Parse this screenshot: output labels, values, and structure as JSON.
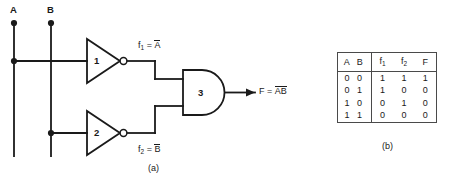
{
  "figure": {
    "caption_a": "(a)",
    "caption_b": "(b)"
  },
  "circuit": {
    "inputs": [
      {
        "label": "A",
        "name": "input-a"
      },
      {
        "label": "B",
        "name": "input-b"
      }
    ],
    "gates": [
      {
        "number": "1",
        "type": "inverter",
        "name": "inverter-gate-1"
      },
      {
        "number": "2",
        "type": "inverter",
        "name": "inverter-gate-2"
      },
      {
        "number": "3",
        "type": "and",
        "name": "and-gate-3"
      }
    ],
    "signals": {
      "f1_name": "f",
      "f1_sub": "1",
      "f1_eq": "=",
      "f1_value": "A",
      "f2_name": "f",
      "f2_sub": "2",
      "f2_eq": "=",
      "f2_value": "B",
      "out_name": "F",
      "out_eq": "=",
      "out_value_a": "A",
      "out_value_b": "B"
    }
  },
  "truth_table": {
    "headers": {
      "ab": "A B",
      "f1_name": "f",
      "f1_sub": "1",
      "f2_name": "f",
      "f2_sub": "2",
      "F": "F"
    },
    "rows": [
      {
        "ab": "0 0",
        "f1": "1",
        "f2": "1",
        "F": "1"
      },
      {
        "ab": "0 1",
        "f1": "1",
        "f2": "0",
        "F": "0"
      },
      {
        "ab": "1 0",
        "f1": "0",
        "f2": "1",
        "F": "0"
      },
      {
        "ab": "1 1",
        "f1": "0",
        "f2": "0",
        "F": "0"
      }
    ]
  },
  "colors": {
    "line": "#1a1a1a",
    "table_border": "#4a4a4a",
    "background": "#ffffff"
  }
}
